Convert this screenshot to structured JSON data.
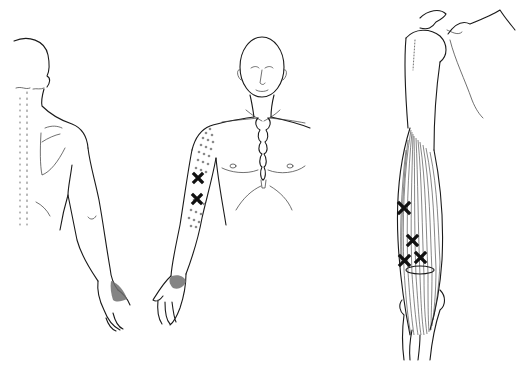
{
  "figure": {
    "panels": [
      {
        "id": "back-view",
        "description": "Posterior view of torso and right arm with pain referral shading on dorsal hand"
      },
      {
        "id": "front-view",
        "description": "Anterior view of head, torso and arm with stippled referral zone on upper arm, two trigger point crosses, shaded thenar area"
      },
      {
        "id": "muscle-view",
        "description": "Humerus and shoulder with brachialis-like muscle fibers and four trigger point crosses"
      }
    ],
    "colors": {
      "line": "#1a1a1a",
      "stipple": "#8a8a8a",
      "shade": "#6f6f6f",
      "background": "#ffffff"
    },
    "trigger_point_counts": {
      "front-view": 2,
      "muscle-view": 4
    }
  }
}
